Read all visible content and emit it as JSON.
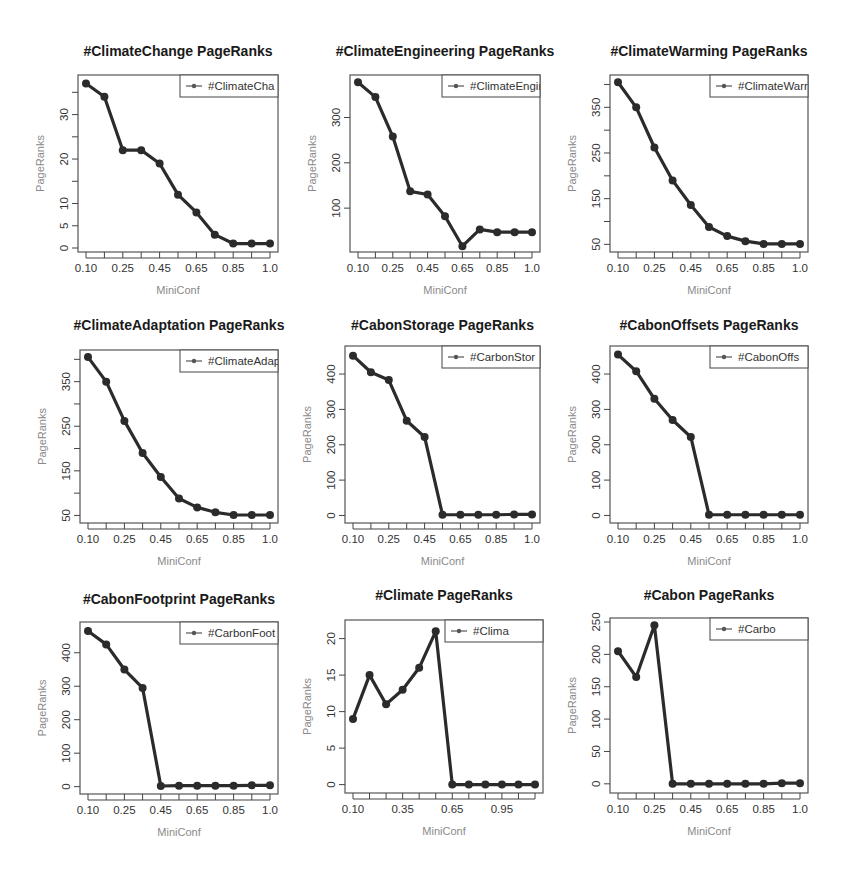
{
  "figure": {
    "xlabel": "MiniConf",
    "ylabel": "PageRanks",
    "line_color": "#2b2b2b"
  },
  "chart_data": [
    {
      "type": "line",
      "title": "#ClimateChange PageRanks",
      "legend": "#ClimateCha",
      "xlabel": "MiniConf",
      "ylabel": "PageRanks",
      "x_tick_labels": [
        "0.10",
        "0.25",
        "0.45",
        "0.65",
        "0.85",
        "1.0"
      ],
      "x_tick_count": 11,
      "label_every": 2,
      "y_ticks": [
        0,
        5,
        10,
        15,
        20,
        25,
        30,
        35
      ],
      "y_tick_labels": [
        "0",
        "5",
        "10",
        "",
        "20",
        "",
        "30",
        ""
      ],
      "ylim": [
        0,
        38
      ],
      "values": [
        37,
        34,
        22,
        22,
        19,
        12,
        8,
        3,
        1,
        1,
        1
      ]
    },
    {
      "type": "line",
      "title": "#ClimateEngineering PageRanks",
      "legend": "#ClimateEngine",
      "xlabel": "MiniConf",
      "ylabel": "PageRanks",
      "x_tick_labels": [
        "0.10",
        "0.25",
        "0.45",
        "0.65",
        "0.85",
        "1.0"
      ],
      "x_tick_count": 11,
      "label_every": 2,
      "y_ticks": [
        100,
        200,
        300
      ],
      "y_tick_labels": [
        "100",
        "200",
        "300"
      ],
      "ylim": [
        12,
        385
      ],
      "values": [
        378,
        345,
        258,
        137,
        130,
        82,
        16,
        53,
        47,
        47,
        47
      ]
    },
    {
      "type": "line",
      "title": "#ClimateWarming PageRanks",
      "legend": "#ClimateWarr",
      "xlabel": "MiniConf",
      "ylabel": "PageRanks",
      "x_tick_labels": [
        "0.10",
        "0.25",
        "0.45",
        "0.65",
        "0.85",
        "1.0"
      ],
      "x_tick_count": 11,
      "label_every": 2,
      "y_ticks": [
        50,
        100,
        150,
        200,
        250,
        300,
        350,
        400
      ],
      "y_tick_labels": [
        "50",
        "",
        "150",
        "",
        "250",
        "",
        "350",
        ""
      ],
      "ylim": [
        42,
        412
      ],
      "values": [
        405,
        350,
        262,
        190,
        136,
        88,
        68,
        57,
        51,
        51,
        51
      ]
    },
    {
      "type": "line",
      "title": "#ClimateAdaptation PageRanks",
      "legend": "#ClimateAdapt",
      "xlabel": "MiniConf",
      "ylabel": "PageRanks",
      "x_tick_labels": [
        "0.10",
        "0.25",
        "0.45",
        "0.65",
        "0.85",
        "1.0"
      ],
      "x_tick_count": 11,
      "label_every": 2,
      "y_ticks": [
        50,
        100,
        150,
        200,
        250,
        300,
        350,
        400
      ],
      "y_tick_labels": [
        "50",
        "",
        "150",
        "",
        "250",
        "",
        "350",
        ""
      ],
      "ylim": [
        42,
        412
      ],
      "values": [
        405,
        350,
        262,
        190,
        136,
        88,
        68,
        57,
        51,
        51,
        51
      ]
    },
    {
      "type": "line",
      "title": "#CabonStorage PageRanks",
      "legend": "#CarbonStor",
      "xlabel": "MiniConf",
      "ylabel": "PageRanks",
      "x_tick_labels": [
        "0.10",
        "0.25",
        "0.45",
        "0.65",
        "0.85",
        "1.0"
      ],
      "x_tick_count": 11,
      "label_every": 2,
      "y_ticks": [
        0,
        100,
        200,
        300,
        400
      ],
      "y_tick_labels": [
        "0",
        "100",
        "200",
        "300",
        "400"
      ],
      "ylim": [
        -10,
        468
      ],
      "values": [
        452,
        405,
        383,
        268,
        222,
        2,
        2,
        2,
        2,
        3,
        3
      ]
    },
    {
      "type": "line",
      "title": "#CabonOffsets PageRanks",
      "legend": "#CabonOffs",
      "xlabel": "MiniConf",
      "ylabel": "PageRanks",
      "x_tick_labels": [
        "0.10",
        "0.25",
        "0.45",
        "0.65",
        "0.85",
        "1.0"
      ],
      "x_tick_count": 11,
      "label_every": 2,
      "y_ticks": [
        0,
        100,
        200,
        300,
        400
      ],
      "y_tick_labels": [
        "0",
        "100",
        "200",
        "300",
        "400"
      ],
      "ylim": [
        -10,
        468
      ],
      "values": [
        455,
        408,
        330,
        270,
        222,
        2,
        2,
        2,
        2,
        2,
        2
      ]
    },
    {
      "type": "line",
      "title": "#CabonFootprint PageRanks",
      "legend": "#CarbonFoot",
      "xlabel": "MiniConf",
      "ylabel": "PageRanks",
      "x_tick_labels": [
        "0.10",
        "0.25",
        "0.45",
        "0.65",
        "0.85",
        "1.0"
      ],
      "x_tick_count": 11,
      "label_every": 2,
      "y_ticks": [
        0,
        100,
        200,
        300,
        400
      ],
      "y_tick_labels": [
        "0",
        "100",
        "200",
        "300",
        "400"
      ],
      "ylim": [
        -10,
        480
      ],
      "values": [
        465,
        425,
        350,
        295,
        2,
        3,
        3,
        3,
        3,
        4,
        4
      ]
    },
    {
      "type": "line",
      "title": "#Climate PageRanks",
      "legend": "#Clima",
      "xlabel": "MiniConf",
      "ylabel": "PageRanks",
      "x_tick_labels": [
        "0.10",
        "0.35",
        "0.65",
        "0.95"
      ],
      "x_tick_count": 12,
      "label_every": 3,
      "y_ticks": [
        0,
        5,
        10,
        15,
        20
      ],
      "y_tick_labels": [
        "0",
        "5",
        "10",
        "15",
        "20"
      ],
      "ylim": [
        -0.6,
        22
      ],
      "values": [
        9,
        15,
        11,
        13,
        16,
        21,
        0,
        0,
        0,
        0,
        0,
        0
      ]
    },
    {
      "type": "line",
      "title": "#Cabon PageRanks",
      "legend": "#Carbo",
      "xlabel": "MiniConf",
      "ylabel": "PageRanks",
      "x_tick_labels": [
        "0.10",
        "0.25",
        "0.45",
        "0.65",
        "0.85",
        "1.0"
      ],
      "x_tick_count": 11,
      "label_every": 2,
      "y_ticks": [
        0,
        50,
        100,
        150,
        200,
        250
      ],
      "y_tick_labels": [
        "0",
        "50",
        "100",
        "150",
        "200",
        "250"
      ],
      "ylim": [
        -8,
        250
      ],
      "values": [
        205,
        165,
        245,
        0,
        0,
        0,
        0,
        0,
        0,
        1,
        1
      ]
    }
  ]
}
